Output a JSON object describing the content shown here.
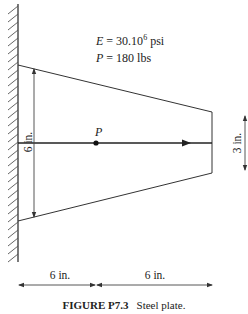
{
  "figure": {
    "label": "FIGURE P7.3",
    "caption": "Steel plate."
  },
  "givens": {
    "E_symbol": "E",
    "E_eq": " = 30.10",
    "E_exp": "6",
    "E_unit": " psi",
    "P_symbol": "P",
    "P_eq": " = 180 lbs"
  },
  "dimensions": {
    "left_height": "6 in.",
    "right_height": "3 in.",
    "span_1": "6 in.",
    "span_2": "6 in."
  },
  "load": {
    "label": "P"
  },
  "colors": {
    "line": "#333333",
    "text": "#222222"
  }
}
